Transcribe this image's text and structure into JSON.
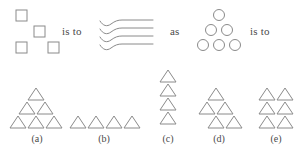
{
  "page": {
    "type": "visual-analogy-question",
    "background_color": "#ffffff",
    "stroke_color": "#8a8a8a",
    "fill_color": "#ffffff",
    "text_color": "#4a4a4a"
  },
  "prompt": {
    "connector_1": "is to",
    "connector_2": "as",
    "connector_3": "is to",
    "term_a": {
      "name": "scattered-squares",
      "shape": "square",
      "count": 4,
      "arrangement": "scattered",
      "size": 11,
      "positions": [
        {
          "x": 16,
          "y": 10
        },
        {
          "x": 34,
          "y": 26
        },
        {
          "x": 16,
          "y": 42
        },
        {
          "x": 48,
          "y": 42
        }
      ]
    },
    "term_b": {
      "name": "wavy-lines",
      "shape": "line",
      "count": 4,
      "arrangement": "stacked-horizontal-bent-lines",
      "line_y": [
        23,
        30,
        37,
        44
      ],
      "x_start": 101,
      "x_end": 152
    },
    "term_c": {
      "name": "triangular-circles",
      "shape": "circle",
      "count": 6,
      "arrangement": "triangle",
      "diameter": 11,
      "rows": [
        {
          "cy": 15,
          "cx": [
            219
          ]
        },
        {
          "cy": 30,
          "cx": [
            211,
            227
          ]
        },
        {
          "cy": 45,
          "cx": [
            203,
            219,
            235
          ]
        }
      ]
    }
  },
  "options": [
    {
      "id": "a",
      "label": "(a)",
      "shape": "triangle",
      "count": 6,
      "arrangement": "triangle",
      "label_x": 36,
      "label_y": 134,
      "triangles": [
        {
          "x": 36,
          "y": 90
        },
        {
          "x": 27,
          "y": 104
        },
        {
          "x": 45,
          "y": 104
        },
        {
          "x": 18,
          "y": 118
        },
        {
          "x": 36,
          "y": 118
        },
        {
          "x": 54,
          "y": 118
        }
      ]
    },
    {
      "id": "b",
      "label": "(b)",
      "shape": "triangle",
      "count": 4,
      "arrangement": "horizontal-row",
      "label_x": 103,
      "label_y": 134,
      "triangles": [
        {
          "x": 76,
          "y": 118
        },
        {
          "x": 94,
          "y": 118
        },
        {
          "x": 112,
          "y": 118
        },
        {
          "x": 130,
          "y": 118
        }
      ]
    },
    {
      "id": "c",
      "label": "(c)",
      "shape": "triangle",
      "count": 4,
      "arrangement": "vertical-column",
      "label_x": 168,
      "label_y": 134,
      "triangles": [
        {
          "x": 168,
          "y": 76
        },
        {
          "x": 168,
          "y": 90
        },
        {
          "x": 168,
          "y": 104
        },
        {
          "x": 168,
          "y": 118
        }
      ]
    },
    {
      "id": "d",
      "label": "(d)",
      "shape": "triangle",
      "count": 5,
      "arrangement": "offset-triangle",
      "label_x": 218,
      "label_y": 134,
      "triangles": [
        {
          "x": 214,
          "y": 90
        },
        {
          "x": 205,
          "y": 104
        },
        {
          "x": 223,
          "y": 104
        },
        {
          "x": 214,
          "y": 118
        },
        {
          "x": 232,
          "y": 118
        }
      ]
    },
    {
      "id": "e",
      "label": "(e)",
      "shape": "triangle",
      "count": 6,
      "arrangement": "grid-2x3",
      "label_x": 275,
      "label_y": 134,
      "triangles": [
        {
          "x": 266,
          "y": 90
        },
        {
          "x": 284,
          "y": 90
        },
        {
          "x": 266,
          "y": 104
        },
        {
          "x": 284,
          "y": 104
        },
        {
          "x": 266,
          "y": 118
        },
        {
          "x": 284,
          "y": 118
        }
      ]
    }
  ],
  "geometry": {
    "triangle_width": 16,
    "triangle_height": 12,
    "square_size": 11,
    "circle_radius": 5.5
  }
}
